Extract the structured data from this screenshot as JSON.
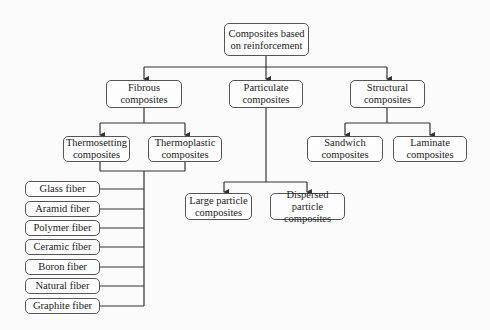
{
  "diagram": {
    "root": "Composites based on reinforcement",
    "level1": [
      {
        "label": "Fibrous composites"
      },
      {
        "label": "Particulate composites"
      },
      {
        "label": "Structural composites"
      }
    ],
    "fibrous_children": [
      {
        "label": "Thermosetting composites"
      },
      {
        "label": "Thermoplastic composites"
      }
    ],
    "fibers": [
      {
        "label": "Glass fiber"
      },
      {
        "label": "Aramid fiber"
      },
      {
        "label": "Polymer fiber"
      },
      {
        "label": "Ceramic fiber"
      },
      {
        "label": "Boron fiber"
      },
      {
        "label": "Natural fiber"
      },
      {
        "label": "Graphite fiber"
      }
    ],
    "particulate_children": [
      {
        "label": "Large particle composites"
      },
      {
        "label": "Dispersed particle composites"
      }
    ],
    "structural_children": [
      {
        "label": "Sandwich composites"
      },
      {
        "label": "Laminate composites"
      }
    ]
  }
}
